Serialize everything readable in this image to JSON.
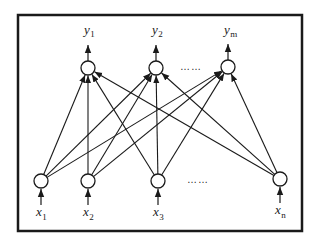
{
  "diagram": {
    "type": "fully-connected two-layer neural network",
    "stroke_color": "#1a1a1a",
    "background": "#ffffff",
    "output_layer": {
      "nodes": [
        {
          "id": "y1",
          "symbol": "y",
          "subscript": "1"
        },
        {
          "id": "y2",
          "symbol": "y",
          "subscript": "2"
        },
        {
          "id": "ym",
          "symbol": "y",
          "subscript": "m"
        }
      ],
      "ellipsis": "……"
    },
    "input_layer": {
      "nodes": [
        {
          "id": "x1",
          "symbol": "x",
          "subscript": "1"
        },
        {
          "id": "x2",
          "symbol": "x",
          "subscript": "2"
        },
        {
          "id": "x3",
          "symbol": "x",
          "subscript": "3"
        },
        {
          "id": "xn",
          "symbol": "x",
          "subscript": "n"
        }
      ],
      "ellipsis": "……"
    },
    "connections": "every input node connects to every output node (arrows point upward)"
  }
}
